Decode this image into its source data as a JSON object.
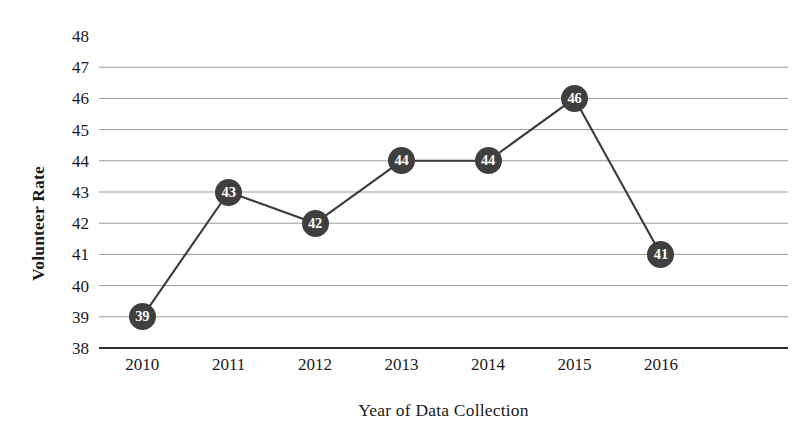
{
  "chart_data": {
    "type": "line",
    "title": "",
    "xlabel": "Year of Data Collection",
    "ylabel": "Volunteer Rate",
    "categories": [
      "2010",
      "2011",
      "2012",
      "2013",
      "2014",
      "2015",
      "2016"
    ],
    "values": [
      39,
      43,
      42,
      44,
      44,
      46,
      41
    ],
    "point_labels": [
      "39",
      "43",
      "42",
      "44",
      "44",
      "46",
      "41"
    ],
    "ylim": [
      38,
      48
    ],
    "y_ticks": [
      "48",
      "47",
      "46",
      "45",
      "44",
      "43",
      "42",
      "41",
      "40",
      "39",
      "38"
    ],
    "y_tick_step": 1,
    "grid": true,
    "gridline_values": [
      47,
      46,
      45,
      44,
      43,
      42,
      41,
      40,
      39,
      38
    ],
    "legend": null,
    "legend_position": "none",
    "series": [
      {
        "name": "Volunteer Rate",
        "values": [
          39,
          43,
          42,
          44,
          44,
          46,
          41
        ]
      }
    ],
    "colors": {
      "line": "#3a3a3a",
      "marker_fill": "#3f3f3f",
      "marker_label": "#ffffff",
      "gridline": "#9a9a9a",
      "axis": "#2b2b2b",
      "text": "#1a1a1a",
      "background": "#ffffff"
    }
  }
}
